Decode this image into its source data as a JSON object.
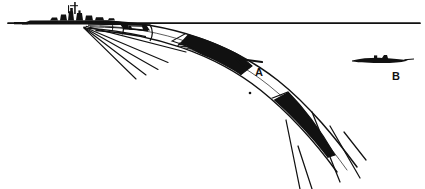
{
  "figure": {
    "background_color": "#ffffff",
    "ink_color": "#111111",
    "width": 425,
    "height": 189
  },
  "horizon": {
    "name": "horizon-line",
    "y": 23,
    "x_start": 8,
    "x_end": 420,
    "thickness": 1.6
  },
  "vessels": [
    {
      "id": "destroyer",
      "name": "surface-warship-silhouette",
      "label": "",
      "position_x": 62,
      "position_y": 23,
      "description": "destroyer silhouette on horizon"
    },
    {
      "id": "submarine",
      "name": "submarine-silhouette",
      "label": "B",
      "label_x": 396,
      "label_y": 76,
      "position_x": 375,
      "position_y": 60,
      "description": "submarine silhouette at right"
    }
  ],
  "beam": {
    "name": "curved-search-beam",
    "origin_x": 83,
    "origin_y": 27,
    "description": "curved fan band sweeping down and right from the ship"
  },
  "segments": [
    {
      "id": "segment-a",
      "name": "beam-segment-a",
      "label": "A",
      "label_x": 259,
      "label_y": 72,
      "hatch": "horizontal",
      "fill": "#111111"
    },
    {
      "id": "segment-lower",
      "name": "beam-segment-lower",
      "label": "",
      "hatch": "vertical",
      "fill": "#111111"
    }
  ],
  "markers": [
    {
      "id": "dot-1",
      "name": "beam-center-dot",
      "x": 250,
      "y": 93,
      "r": 1.3
    }
  ],
  "labels": {
    "a": "A",
    "b": "B"
  }
}
